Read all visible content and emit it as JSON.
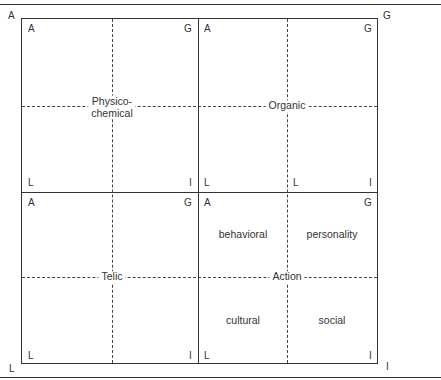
{
  "diagram": {
    "outer_labels": {
      "top_left": "A",
      "top_right": "G",
      "bottom_left": "L",
      "bottom_right": "I"
    },
    "quadrants": [
      {
        "id": "top-left",
        "system": "Physico-\nchemical",
        "system_line1": "Physico-",
        "system_line2": "chemical",
        "corners": {
          "A": "A",
          "G": "G",
          "L": "L",
          "I": "I"
        }
      },
      {
        "id": "top-right",
        "system": "Organic",
        "corners": {
          "A": "A",
          "G": "G",
          "L": "L",
          "I": "I"
        },
        "inner_L": "L"
      },
      {
        "id": "bottom-left",
        "system": "Telic",
        "corners": {
          "A": "A",
          "G": "G",
          "L": "L",
          "I": "I"
        }
      },
      {
        "id": "bottom-right",
        "system": "Action",
        "corners": {
          "A": "A",
          "G": "G",
          "L": "L",
          "I": "I"
        },
        "subsystems": {
          "top_left": "behavioral",
          "top_right": "personality",
          "bottom_left": "cultural",
          "bottom_right": "social"
        }
      }
    ]
  }
}
